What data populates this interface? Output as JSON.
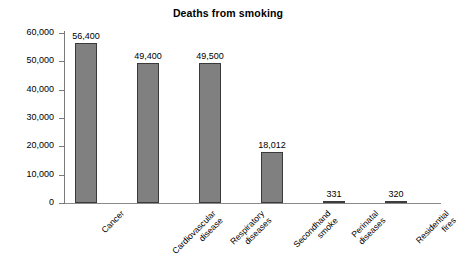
{
  "chart_data": {
    "type": "bar",
    "title": "Deaths from smoking",
    "xlabel": "",
    "ylabel": "",
    "ylim": [
      0,
      60000
    ],
    "grid": false,
    "legend": "none",
    "y_ticks": [
      "0",
      "10,000",
      "20,000",
      "30,000",
      "40,000",
      "50,000",
      "60,000"
    ],
    "y_tick_values": [
      0,
      10000,
      20000,
      30000,
      40000,
      50000,
      60000
    ],
    "categories": [
      "Cancer",
      "Cardiovascular disease",
      "Respiratory diseases",
      "Secondhand smoke",
      "Perinatal diseases",
      "Residential fires"
    ],
    "category_lines": [
      [
        "Cancer"
      ],
      [
        "Cardiovascular",
        "disease"
      ],
      [
        "Respiratory",
        "diseases"
      ],
      [
        "Secondhand",
        "smoke"
      ],
      [
        "Perinatal",
        "diseases"
      ],
      [
        "Residential",
        "fires"
      ]
    ],
    "values": [
      56400,
      49400,
      49500,
      18012,
      331,
      320
    ],
    "value_labels": [
      "56,400",
      "49,400",
      "49,500",
      "18,012",
      "331",
      "320"
    ],
    "bar_color": "#808080",
    "bar_border_color": "#3a3a3a",
    "axis_color": "#7a7a7a"
  }
}
